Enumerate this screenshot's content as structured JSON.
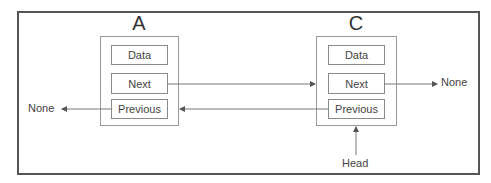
{
  "diagram": {
    "nodes": [
      {
        "title": "A",
        "fields": [
          "Data",
          "Next",
          "Previous"
        ]
      },
      {
        "title": "C",
        "fields": [
          "Data",
          "Next",
          "Previous"
        ]
      }
    ],
    "labels": {
      "left_none": "None",
      "right_none": "None",
      "head": "Head"
    },
    "edges": [
      {
        "from": "A.Next",
        "to": "C"
      },
      {
        "from": "C.Previous",
        "to": "A"
      },
      {
        "from": "A.Previous",
        "to": "None"
      },
      {
        "from": "C.Next",
        "to": "None"
      },
      {
        "from": "Head",
        "to": "C"
      }
    ],
    "colors": {
      "frame": "#555555",
      "line": "#666666",
      "box": "#9a9a9a"
    }
  }
}
